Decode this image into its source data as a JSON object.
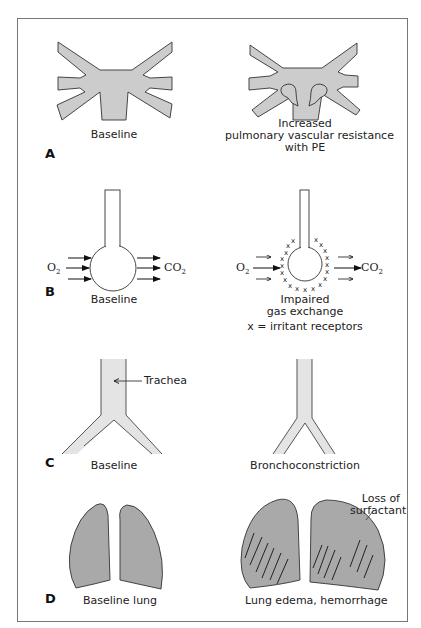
{
  "figure": {
    "fill_color": "#cccccc",
    "lung_fill_color": "#a9a9a9",
    "stroke_color": "#222222",
    "frame_color": "#777777"
  },
  "panels": [
    {
      "letter": "A",
      "left_caption": "Baseline",
      "right_caption_lines": [
        "Increased",
        "pulmonary vascular resistance",
        "with PE"
      ]
    },
    {
      "letter": "B",
      "left_caption": "Baseline",
      "right_caption_lines": [
        "Impaired",
        "gas exchange",
        "x = irritant receptors"
      ],
      "input_label": "O",
      "input_sub": "2",
      "output_label": "CO",
      "output_sub": "2",
      "receptor_marker": "x"
    },
    {
      "letter": "C",
      "left_caption": "Baseline",
      "right_caption": "Bronchoconstriction",
      "pointer_label": "Trachea"
    },
    {
      "letter": "D",
      "left_caption": "Baseline lung",
      "right_caption": "Lung edema, hemorrhage",
      "annotation_lines": [
        "Loss of",
        "surfactant"
      ]
    }
  ]
}
